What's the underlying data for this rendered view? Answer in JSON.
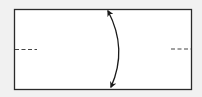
{
  "diagram": {
    "type": "origami-fold-step",
    "background": "#f1f1f1",
    "paper": {
      "x": 14,
      "y": 9,
      "width": 178,
      "height": 81,
      "fill": "#ffffff",
      "stroke": "#2a2a2a"
    },
    "fold_marks": [
      {
        "side": "left",
        "x1": 15,
        "x2": 37,
        "y": 49
      },
      {
        "side": "right",
        "x1": 171,
        "x2": 191,
        "y": 49
      }
    ],
    "arrow": {
      "from": [
        107,
        10
      ],
      "to": [
        111,
        88
      ],
      "control": [
        128,
        49
      ],
      "double_headed": true,
      "color": "#1a1a1a"
    }
  }
}
